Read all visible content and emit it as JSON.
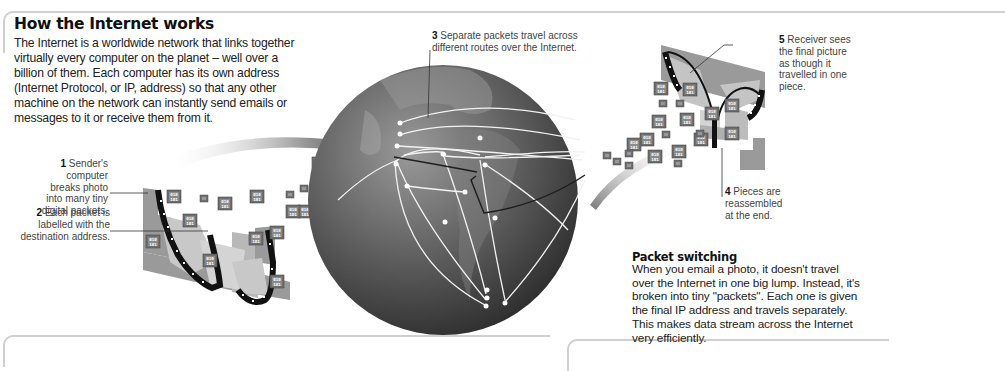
{
  "title": "How the Internet works",
  "intro": "The Internet is a worldwide network that links together virtually every computer on the planet – well over a billion of them. Each computer has its own address (Internet Protocol, or IP, address) so that any other machine on the network can instantly send emails or messages to it or receive them from it.",
  "steps": [
    {
      "num": "1",
      "text": "Sender's computer breaks photo into many tiny digital packets."
    },
    {
      "num": "2",
      "text": "Each packet is labelled with the destination address."
    },
    {
      "num": "3",
      "text": "Separate packets travel across different routes over the Internet."
    },
    {
      "num": "4",
      "text": "Pieces are reassembled at the end."
    },
    {
      "num": "5",
      "text": "Receiver sees the final picture as though it travelled in one piece."
    }
  ],
  "packet_switching": {
    "title": "Packet switching",
    "body": "When you email a photo, it doesn't travel over the Internet in one big lump. Instead, it's broken into tiny \"packets\". Each one is given the final IP address and travels separately. This makes data stream across the Internet very efficiently."
  },
  "packet_label": {
    "line1": "010",
    "line2": "101"
  },
  "colors": {
    "globe_dark": "#3a3a3a",
    "globe_light": "#8a8a8a",
    "route_line": "#f2f2f2",
    "packet": "#6e6e6e",
    "frame": "#cfcfcf"
  }
}
